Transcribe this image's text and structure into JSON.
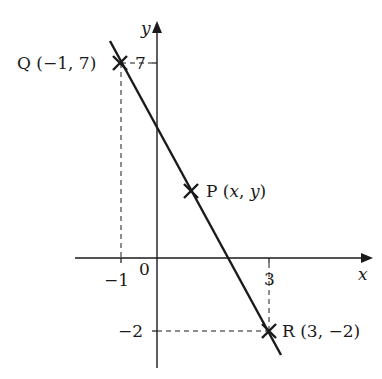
{
  "axes": {
    "x_label": "x",
    "y_label": "y",
    "origin_label": "0",
    "x_ticks": [
      {
        "value": -1,
        "label": "−1"
      },
      {
        "value": 3,
        "label": "3"
      }
    ],
    "y_ticks": [
      {
        "value": 7,
        "label": "7"
      },
      {
        "value": -2,
        "label": "−2"
      }
    ]
  },
  "points": {
    "Q": {
      "name": "Q",
      "coords": "(−1, 7)",
      "x": -1,
      "y": 7
    },
    "P": {
      "name": "P",
      "coords_open": "(",
      "coords_x": "x",
      "coords_sep": ", ",
      "coords_y": "y",
      "coords_close": ")"
    },
    "R": {
      "name": "R",
      "coords": "(3, −2)",
      "x": 3,
      "y": -2
    }
  },
  "colors": {
    "ink": "#1a1a1a",
    "background": "#ffffff"
  }
}
